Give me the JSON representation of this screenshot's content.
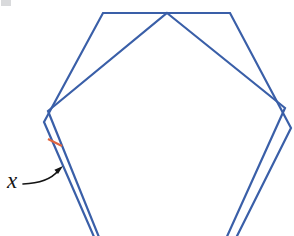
{
  "figure": {
    "label": "x",
    "colors": {
      "line": "#3a5fa8",
      "tick": "#e0653f",
      "annotation": "#141414",
      "artifact": "#b9bcbf"
    },
    "canvas": {
      "width": 294,
      "height": 236
    },
    "shapes": {
      "hexagon_points": "103,13 230,13 291,128 232,246 98,246 44,122",
      "pentagon_points": "167,13 285,108 220,252 105,252 48,111"
    },
    "annotations": {
      "tick_path": "M 48,139 L 62,146",
      "arrow_path": "M 23,184 Q 48,183 58,171",
      "arrow_head_points": "63,166 58,174 54.4,169.8",
      "artifact_path": "M 1,0 L 11,0 L 11,6 L 1,6 Z"
    }
  }
}
